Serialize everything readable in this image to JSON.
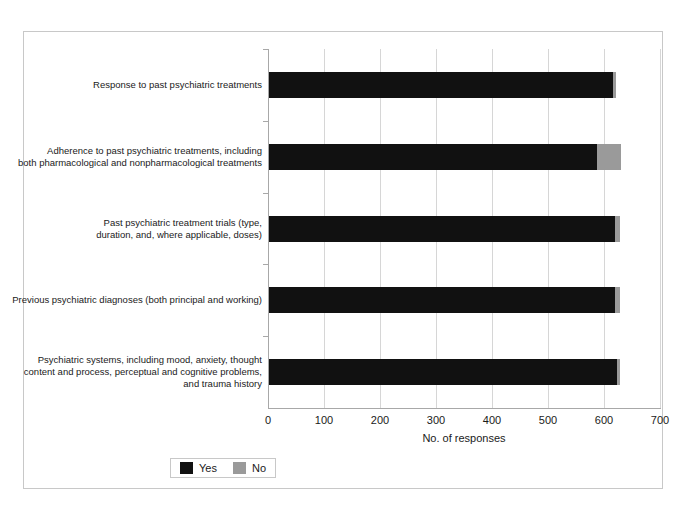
{
  "chart_data": {
    "type": "bar",
    "orientation": "horizontal",
    "stacked": true,
    "title": "",
    "subtitle": "",
    "xlabel": "No. of responses",
    "ylabel": "",
    "xlim": [
      0,
      700
    ],
    "xticks": [
      0,
      100,
      200,
      300,
      400,
      500,
      600,
      700
    ],
    "xticklabels": [
      "0",
      "100",
      "200",
      "300",
      "400",
      "500",
      "600",
      "700"
    ],
    "grid": true,
    "grid_axis": "x",
    "legend_position": "bottom-left",
    "categories": [
      "Psychiatric systems, including mood, anxiety, thought content and process, perceptual and cognitive problems, and trauma history",
      "Previous psychiatric diagnoses (both principal and working)",
      "Past psychiatric treatment trials (type, duration, and, where applicable, doses)",
      "Adherence to past psychiatric treatments, including both pharmacological and nonpharmacological treatments",
      "Response to past psychiatric treatments"
    ],
    "category_lines": [
      [
        "Psychiatric systems, including mood, anxiety, thought",
        "content and process, perceptual and cognitive problems,",
        "and trauma history"
      ],
      [
        "Previous psychiatric diagnoses (both principal and working)"
      ],
      [
        "Past psychiatric treatment trials (type,",
        "duration, and, where applicable, doses)"
      ],
      [
        "Adherence to past psychiatric treatments, including",
        "both pharmacological and nonpharmacological treatments"
      ],
      [
        "Response to past psychiatric treatments"
      ]
    ],
    "series": [
      {
        "name": "Yes",
        "color": "#111111",
        "values": [
          623,
          620,
          620,
          587,
          616
        ]
      },
      {
        "name": "No",
        "color": "#9a9a9a",
        "values": [
          5,
          8,
          8,
          43,
          6
        ]
      }
    ],
    "legend": [
      {
        "label": "Yes",
        "color": "#111111"
      },
      {
        "label": "No",
        "color": "#9a9a9a"
      }
    ]
  },
  "figure": {
    "border_color": "#c8c8c8",
    "background": "#ffffff"
  }
}
